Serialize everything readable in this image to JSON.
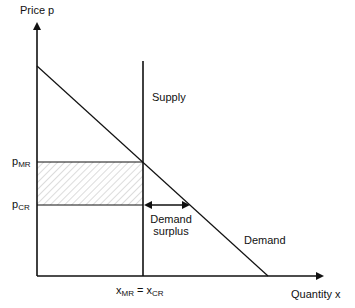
{
  "diagram": {
    "axes": {
      "y_label": "Price p",
      "x_label": "Quantity x"
    },
    "curves": {
      "supply_label": "Supply",
      "demand_label": "Demand"
    },
    "price_levels": {
      "p_mr": {
        "base": "p",
        "sub": "MR"
      },
      "p_cr": {
        "base": "p",
        "sub": "CR"
      }
    },
    "quantity_label": {
      "left_base": "x",
      "left_sub": "MR",
      "equals": " = ",
      "right_base": "x",
      "right_sub": "CR"
    },
    "annotation": {
      "line1": "Demand",
      "line2": "surplus"
    },
    "colors": {
      "line": "#111111",
      "hatch": "#9a9a9a",
      "background": "#ffffff"
    }
  }
}
